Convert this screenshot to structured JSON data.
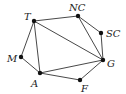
{
  "diagram": {
    "type": "graph",
    "nodes": [
      {
        "id": "T",
        "label": "T",
        "x": 34,
        "y": 21,
        "lx": 24,
        "ly": 20
      },
      {
        "id": "NC",
        "label": "NC",
        "x": 78,
        "y": 16,
        "lx": 69,
        "ly": 11
      },
      {
        "id": "SC",
        "label": "SC",
        "x": 101,
        "y": 33,
        "lx": 106,
        "ly": 37
      },
      {
        "id": "G",
        "label": "G",
        "x": 103,
        "y": 60,
        "lx": 107,
        "ly": 67
      },
      {
        "id": "F",
        "label": "F",
        "x": 80,
        "y": 80,
        "lx": 81,
        "ly": 92
      },
      {
        "id": "A",
        "label": "A",
        "x": 40,
        "y": 73,
        "lx": 31,
        "ly": 87
      },
      {
        "id": "M",
        "label": "M",
        "x": 21,
        "y": 57,
        "lx": 7,
        "ly": 62
      }
    ],
    "edges": [
      [
        "T",
        "NC"
      ],
      [
        "NC",
        "SC"
      ],
      [
        "SC",
        "G"
      ],
      [
        "NC",
        "G"
      ],
      [
        "T",
        "G"
      ],
      [
        "T",
        "M"
      ],
      [
        "M",
        "A"
      ],
      [
        "T",
        "A"
      ],
      [
        "A",
        "G"
      ],
      [
        "A",
        "F"
      ],
      [
        "F",
        "G"
      ]
    ]
  }
}
